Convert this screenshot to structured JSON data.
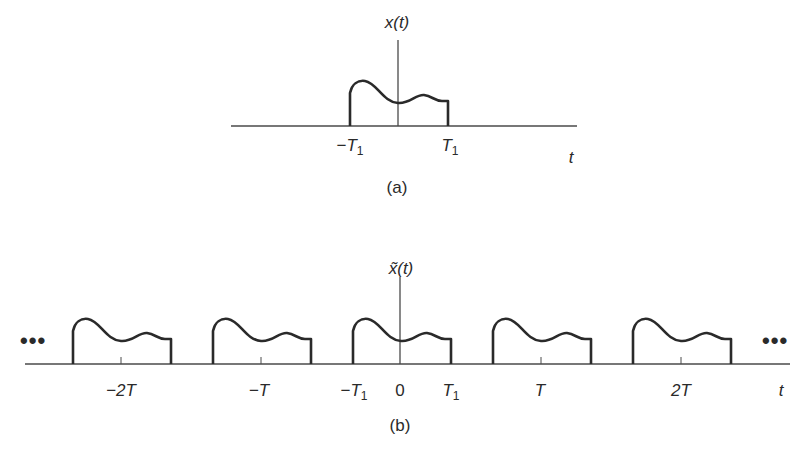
{
  "panel_a": {
    "signal_label_base": "x",
    "signal_label_arg": "(t)",
    "tick_labels": {
      "neg_T1_sign": "−",
      "T": "T",
      "sub": "1"
    },
    "axis_label": "t",
    "caption": "(a)"
  },
  "panel_b": {
    "signal_label_base": "x̃",
    "signal_label_arg": "(t)",
    "period_labels": [
      "−2T",
      "−T",
      "T",
      "2T"
    ],
    "neg_T1_sign": "−",
    "T1_base": "T",
    "T1_sub": "1",
    "zero_label": "0",
    "axis_label": "t",
    "ellipsis_left": "•••",
    "ellipsis_right": "•••",
    "caption": "(b)",
    "periods_shown": [
      -2,
      -1,
      0,
      1,
      2
    ]
  }
}
